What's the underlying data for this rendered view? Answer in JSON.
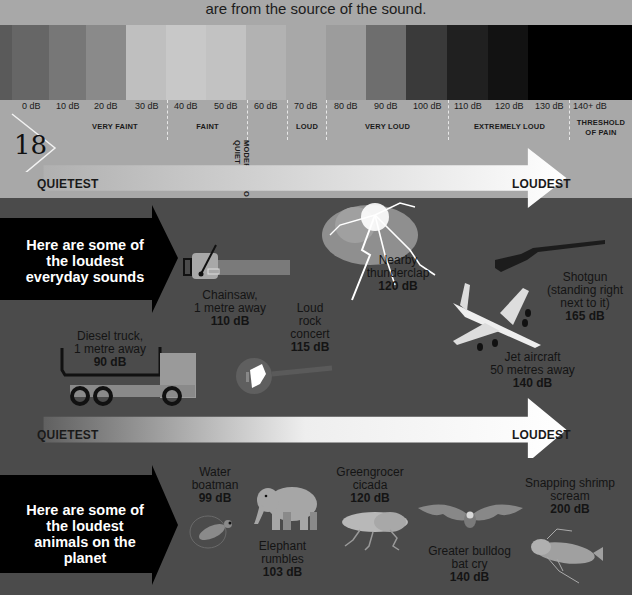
{
  "caption": "are from the source of the sound.",
  "page_number": "18",
  "scale": {
    "segments": [
      {
        "label": "0 dB",
        "color": "#5e5e5e"
      },
      {
        "label": "10 dB",
        "color": "#6a6a6a"
      },
      {
        "label": "20 dB",
        "color": "#7b7b7b"
      },
      {
        "label": "30 dB",
        "color": "#8e8e8e"
      },
      {
        "label": "40 dB",
        "color": "#c2c2c2"
      },
      {
        "label": "50 dB",
        "color": "#c9c9c9"
      },
      {
        "label": "60 dB",
        "color": "#b4b4b4"
      },
      {
        "label": "70 dB",
        "color": "#a6a6a6"
      },
      {
        "label": "80 dB",
        "color": "#9a9a9a"
      },
      {
        "label": "90 dB",
        "color": "#6e6e6e"
      },
      {
        "label": "100 dB",
        "color": "#3c3c3c"
      },
      {
        "label": "110 dB",
        "color": "#222222"
      },
      {
        "label": "120 dB",
        "color": "#161616"
      },
      {
        "label": "130 dB",
        "color": "#0a0a0a"
      },
      {
        "label": "140+ dB",
        "color": "#000000"
      }
    ],
    "categories": [
      {
        "label": "VERY FAINT"
      },
      {
        "label": "FAINT"
      },
      {
        "label": "MODERATE TO QUIET"
      },
      {
        "label": "LOUD"
      },
      {
        "label": "VERY LOUD"
      },
      {
        "label": "EXTREMELY LOUD"
      },
      {
        "label": "THRESHOLD OF PAIN"
      }
    ]
  },
  "arrow_top": {
    "left": "QUIETEST",
    "right": "LOUDEST"
  },
  "arrow_bottom": {
    "left": "QUIETEST",
    "right": "LOUDEST"
  },
  "everyday": {
    "banner": "Here are some of the loudest everyday sounds",
    "items": [
      {
        "name": "Diesel truck,",
        "detail": "1 metre away",
        "db": "90 dB",
        "icon": "truck-icon"
      },
      {
        "name": "Chainsaw,",
        "detail": "1 metre away",
        "db": "110 dB",
        "icon": "chainsaw-icon"
      },
      {
        "name": "Loud",
        "detail": "rock concert",
        "db": "115 dB",
        "icon": "guitar-icon"
      },
      {
        "name": "Nearby",
        "detail": "thunderclap",
        "db": "120 dB",
        "icon": "lightning-icon"
      },
      {
        "name": "Jet aircraft",
        "detail": "50 metres away",
        "db": "140 dB",
        "icon": "airplane-icon"
      },
      {
        "name": "Shotgun",
        "detail": "(standing right next to it)",
        "db": "165 dB",
        "icon": "shotgun-icon"
      }
    ]
  },
  "animals": {
    "banner": "Here are some of the loudest animals on the planet",
    "items": [
      {
        "name": "Water",
        "detail": "boatman",
        "db": "99 dB",
        "icon": "water-boatman-icon"
      },
      {
        "name": "Elephant",
        "detail": "rumbles",
        "db": "103 dB",
        "icon": "elephant-icon"
      },
      {
        "name": "Greengrocer",
        "detail": "cicada",
        "db": "120 dB",
        "icon": "cicada-icon"
      },
      {
        "name": "Greater bulldog",
        "detail": "bat cry",
        "db": "140 dB",
        "icon": "bat-icon"
      },
      {
        "name": "Snapping shrimp",
        "detail": "scream",
        "db": "200 dB",
        "icon": "shrimp-icon"
      }
    ]
  }
}
